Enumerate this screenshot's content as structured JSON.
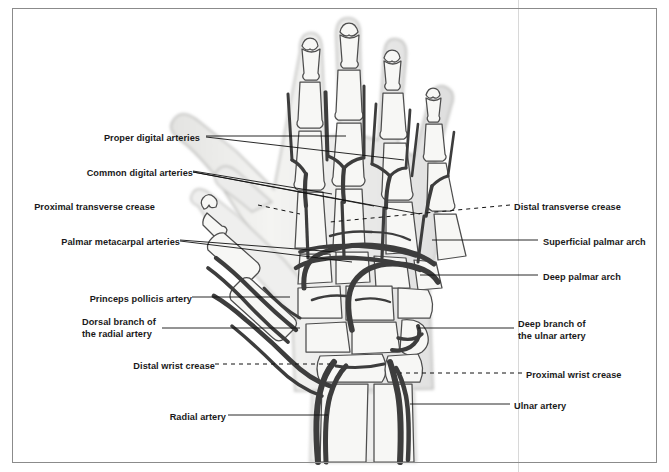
{
  "figure": {
    "frame_color": "#8b8b8b",
    "label_color": "#1a1a1a",
    "leader_color": "#111111"
  },
  "labels_left": [
    {
      "id": "proper-digital-arteries",
      "text": "Proper digital arteries",
      "x": 200,
      "y": 139,
      "line2": ""
    },
    {
      "id": "common-digital-arteries",
      "text": "Common digital arteries",
      "x": 186,
      "y": 174,
      "line2": ""
    },
    {
      "id": "proximal-transverse-crease",
      "text": "Proximal transverse crease",
      "x": 155,
      "y": 208,
      "line2": ""
    },
    {
      "id": "palmar-metacarpal-arteries",
      "text": "Palmar metacarpal arteries",
      "x": 172,
      "y": 243,
      "line2": ""
    },
    {
      "id": "princeps-pollicis-artery",
      "text": "Princeps pollicis artery",
      "x": 186,
      "y": 300,
      "line2": ""
    },
    {
      "id": "dorsal-branch-radial-artery",
      "text": "Dorsal branch of",
      "x": 155,
      "y": 323,
      "line2": "the radial artery"
    },
    {
      "id": "distal-wrist-crease",
      "text": "Distal wrist crease",
      "x": 209,
      "y": 367,
      "line2": ""
    },
    {
      "id": "radial-artery",
      "text": "Radial artery",
      "x": 222,
      "y": 418,
      "line2": ""
    }
  ],
  "labels_right": [
    {
      "id": "distal-transverse-crease",
      "text": "Distal transverse crease",
      "x": 514,
      "y": 208,
      "line2": ""
    },
    {
      "id": "superficial-palmar-arch",
      "text": "Superficial palmar arch",
      "x": 543,
      "y": 243,
      "line2": ""
    },
    {
      "id": "deep-palmar-arch",
      "text": "Deep palmar arch",
      "x": 543,
      "y": 278,
      "line2": ""
    },
    {
      "id": "deep-branch-ulnar-artery",
      "text": "Deep branch of",
      "x": 518,
      "y": 325,
      "line2": "the ulnar artery"
    },
    {
      "id": "proximal-wrist-crease",
      "text": "Proximal wrist crease",
      "x": 526,
      "y": 376,
      "line2": ""
    },
    {
      "id": "ulnar-artery",
      "text": "Ulnar artery",
      "x": 514,
      "y": 407,
      "line2": ""
    }
  ],
  "legend": {
    "bone_fill": "#f2f2f0",
    "soft_tissue_fill": "#ebebe9",
    "artery_stroke": "#3a3a3a",
    "outline_stroke": "#4a4a4a"
  }
}
